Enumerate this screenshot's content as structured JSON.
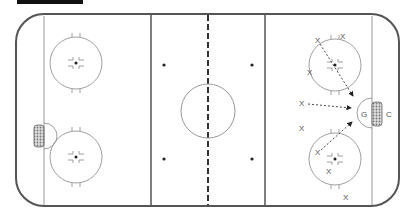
{
  "diagram": {
    "type": "hockey-rink-drill",
    "colors": {
      "board": "#555555",
      "line": "#666666",
      "thin": "#999999",
      "arrow": "#333333",
      "net_fill": "#bbbbbb"
    },
    "labels": {
      "goalie": "G",
      "coach": "C",
      "player": "X"
    },
    "players": [
      {
        "x": 318,
        "y": 40
      },
      {
        "x": 343,
        "y": 36
      },
      {
        "x": 310,
        "y": 72
      },
      {
        "x": 302,
        "y": 102
      },
      {
        "x": 302,
        "y": 128
      },
      {
        "x": 318,
        "y": 152
      },
      {
        "x": 329,
        "y": 171
      },
      {
        "x": 346,
        "y": 197
      }
    ],
    "passes": [
      {
        "from": [
          320,
          44
        ],
        "to": [
          352,
          96
        ]
      },
      {
        "from": [
          308,
          104
        ],
        "to": [
          350,
          107
        ]
      },
      {
        "from": [
          321,
          150
        ],
        "to": [
          352,
          121
        ]
      }
    ]
  }
}
